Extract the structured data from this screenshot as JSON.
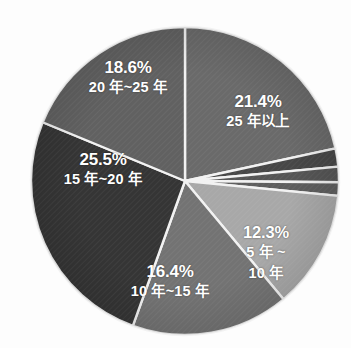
{
  "chart_data": {
    "type": "pie",
    "title": "",
    "subtitle": "",
    "xlabel": "",
    "ylabel": "",
    "legend_position": "none",
    "grid": false,
    "units": "percent",
    "center": {
      "x": 185,
      "y": 181
    },
    "radius": 154,
    "start_angle_deg": -90,
    "direction": "clockwise",
    "separator_color": "#f2f2f2",
    "background": "#fdfdfd",
    "categories": [
      "25 年以上",
      "",
      "",
      "",
      "5 年 ~ 10 年",
      "10 年~15 年",
      "15 年~20 年",
      "20 年~25 年"
    ],
    "values": [
      21.4,
      1.9,
      1.6,
      1.4,
      12.3,
      16.4,
      25.5,
      18.6
    ],
    "colors": [
      "#6a6a6a",
      "#474747",
      "#555555",
      "#5e5e5e",
      "#a8a8a8",
      "#737373",
      "#353535",
      "#616161"
    ],
    "slices": [
      {
        "label_pct": "21.4%",
        "label_cat": "25 年以上",
        "label_cat2": "",
        "value": 21.4,
        "color": "#6a6a6a",
        "labeled": true
      },
      {
        "label_pct": "",
        "label_cat": "",
        "label_cat2": "",
        "value": 1.9,
        "color": "#474747",
        "labeled": false
      },
      {
        "label_pct": "",
        "label_cat": "",
        "label_cat2": "",
        "value": 1.6,
        "color": "#555555",
        "labeled": false
      },
      {
        "label_pct": "",
        "label_cat": "",
        "label_cat2": "",
        "value": 1.4,
        "color": "#5e5e5e",
        "labeled": false
      },
      {
        "label_pct": "12.3%",
        "label_cat": "5 年 ~",
        "label_cat2": "10 年",
        "value": 12.3,
        "color": "#a8a8a8",
        "labeled": true
      },
      {
        "label_pct": "16.4%",
        "label_cat": "10 年~15 年",
        "label_cat2": "",
        "value": 16.4,
        "color": "#737373",
        "labeled": true
      },
      {
        "label_pct": "25.5%",
        "label_cat": "15 年~20 年",
        "label_cat2": "",
        "value": 25.5,
        "color": "#353535",
        "labeled": true
      },
      {
        "label_pct": "18.6%",
        "label_cat": "20 年~25 年",
        "label_cat2": "",
        "value": 18.6,
        "color": "#616161",
        "labeled": true
      }
    ]
  }
}
